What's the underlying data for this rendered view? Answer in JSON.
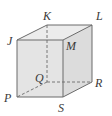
{
  "diagram": {
    "type": "cube",
    "colors": {
      "background": "#ffffff",
      "front_face": "#e4e4e4",
      "top_face": "#ececec",
      "right_face": "#dcdcdc",
      "edge": "#6b6b6b",
      "label": "#3a3a3a"
    },
    "vertices": {
      "J": {
        "label": "J",
        "x": 17,
        "y": 40
      },
      "M": {
        "label": "M",
        "x": 63,
        "y": 40
      },
      "P": {
        "label": "P",
        "x": 17,
        "y": 97
      },
      "S": {
        "label": "S",
        "x": 63,
        "y": 97
      },
      "K": {
        "label": "K",
        "x": 47,
        "y": 25
      },
      "L": {
        "label": "L",
        "x": 92,
        "y": 25
      },
      "Q": {
        "label": "Q",
        "x": 47,
        "y": 82
      },
      "R": {
        "label": "R",
        "x": 92,
        "y": 82
      }
    },
    "labels": [
      {
        "id": "K",
        "text": "K",
        "x": 43,
        "y": 20
      },
      {
        "id": "L",
        "text": "L",
        "x": 96,
        "y": 20
      },
      {
        "id": "J",
        "text": "J",
        "x": 7,
        "y": 45
      },
      {
        "id": "M",
        "text": "M",
        "x": 66,
        "y": 50
      },
      {
        "id": "Q",
        "text": "Q",
        "x": 35,
        "y": 82
      },
      {
        "id": "R",
        "text": "R",
        "x": 95,
        "y": 87
      },
      {
        "id": "P",
        "text": "P",
        "x": 4,
        "y": 102
      },
      {
        "id": "S",
        "text": "S",
        "x": 58,
        "y": 112
      }
    ],
    "edges_visible": [
      "JM",
      "MS",
      "SP",
      "PJ",
      "JK",
      "KL",
      "LM",
      "LR",
      "RS"
    ],
    "edges_hidden": [
      "KQ",
      "QP",
      "QR"
    ]
  }
}
